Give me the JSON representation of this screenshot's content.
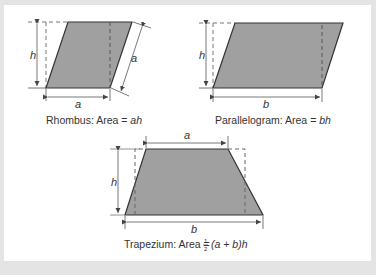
{
  "colors": {
    "background": "#e4e4e4",
    "panel": "#ffffff",
    "shape_fill": "#a0a0a0",
    "shape_outline": "#333333",
    "dimension_line": "#555555",
    "dashed_line": "#777777"
  },
  "figures": {
    "rhombus": {
      "side_label_bottom": "a",
      "side_label_slant": "a",
      "height_label": "h",
      "caption_prefix": "Rhombus: Area = ",
      "caption_formula": "ah"
    },
    "parallelogram": {
      "base_label": "b",
      "height_label": "h",
      "caption_prefix": "Parallelogram: Area = ",
      "caption_formula": "bh"
    },
    "trapezium": {
      "top_label": "a",
      "base_label": "b",
      "height_label": "h",
      "caption_prefix": "Trapezium: Area = ",
      "fraction_num": "1",
      "fraction_den": "2",
      "caption_formula": "(a + b)h"
    }
  },
  "bottom_caption": ""
}
